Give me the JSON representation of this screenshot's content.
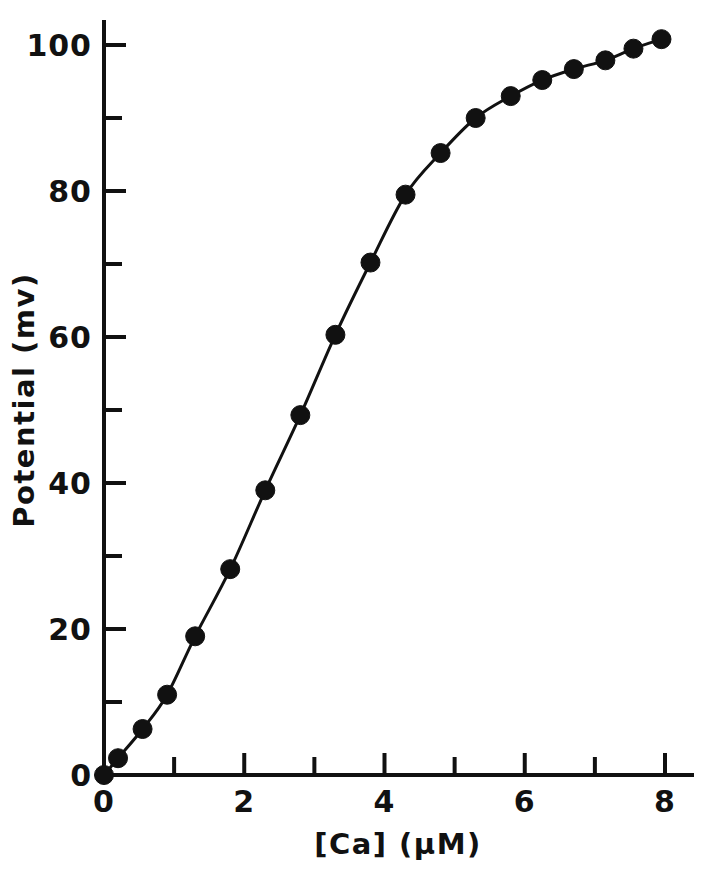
{
  "chart_data": {
    "type": "line",
    "title": "",
    "subtitle": "",
    "xlabel": "[Ca]   (µM)",
    "ylabel": "Potential  (mv)",
    "xlim": [
      0,
      8.4
    ],
    "ylim": [
      0,
      104
    ],
    "grid": false,
    "legend": null,
    "marker": "filled-circle",
    "x_major_ticks": [
      0,
      2,
      4,
      6,
      8
    ],
    "x_major_tick_labels": [
      "0",
      "2",
      "4",
      "6",
      "8"
    ],
    "x_minor_ticks": [
      1,
      3,
      5,
      7
    ],
    "y_major_ticks": [
      0,
      20,
      40,
      60,
      80,
      100
    ],
    "y_major_tick_labels": [
      "0",
      "20",
      "40",
      "60",
      "80",
      "100"
    ],
    "y_minor_ticks": [
      10,
      30,
      50,
      70,
      90
    ],
    "series": [
      {
        "name": "Potential vs [Ca]",
        "x": [
          0.0,
          0.2,
          0.55,
          0.9,
          1.3,
          1.8,
          2.3,
          2.8,
          3.3,
          3.8,
          4.3,
          4.8,
          5.3,
          5.8,
          6.25,
          6.7,
          7.15,
          7.55,
          7.95
        ],
        "y": [
          0.0,
          2.3,
          6.3,
          11.0,
          19.0,
          28.2,
          39.0,
          49.3,
          60.3,
          70.2,
          79.5,
          85.2,
          90.0,
          93.0,
          95.2,
          96.7,
          97.9,
          99.5,
          100.8
        ]
      }
    ]
  },
  "axes": {
    "y_axis_name": "potential-axis",
    "x_axis_name": "calcium-concentration-axis"
  }
}
